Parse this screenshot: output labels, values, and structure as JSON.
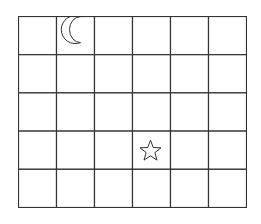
{
  "grid": {
    "columns": 6,
    "rows": 5,
    "line_color": "#333333",
    "background": "#ffffff"
  },
  "symbols": [
    {
      "type": "crescent-moon",
      "row": 0,
      "col": 1,
      "style": "outline"
    },
    {
      "type": "star",
      "row": 3,
      "col": 3,
      "style": "outline"
    }
  ]
}
